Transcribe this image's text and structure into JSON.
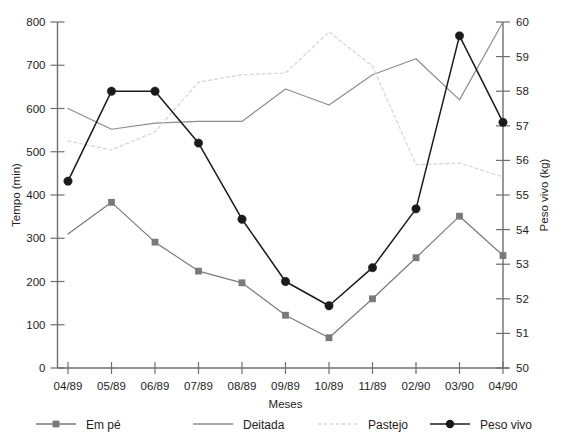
{
  "chart_data": {
    "type": "line",
    "title": "",
    "xlabel": "Meses",
    "ylabel": "Tempo (min)",
    "y2label": "Peso vivo (kg)",
    "categories": [
      "04/89",
      "05/89",
      "06/89",
      "07/89",
      "08/89",
      "09/89",
      "10/89",
      "11/89",
      "02/90",
      "03/90",
      "04/90"
    ],
    "ylim": [
      0,
      800
    ],
    "yticks": [
      0,
      100,
      200,
      300,
      400,
      500,
      600,
      700,
      800
    ],
    "y2lim": [
      50,
      60
    ],
    "y2ticks": [
      50,
      51,
      52,
      53,
      54,
      55,
      56,
      57,
      58,
      59,
      60
    ],
    "grid": false,
    "legend_position": "bottom",
    "series": [
      {
        "name": "Em pé",
        "axis": "left",
        "color": "#7a7a7a",
        "marker": "square",
        "dash": "solid",
        "values": [
          310,
          383,
          291,
          224,
          197,
          122,
          70,
          160,
          255,
          351,
          260
        ]
      },
      {
        "name": "Deitada",
        "axis": "left",
        "color": "#8d8d8d",
        "marker": "none",
        "dash": "solid",
        "values": [
          600,
          552,
          566,
          570,
          570,
          645,
          608,
          678,
          715,
          620,
          800
        ]
      },
      {
        "name": "Pastejo",
        "axis": "left",
        "color": "#d4d4d4",
        "marker": "none",
        "dash": "dotted",
        "values": [
          525,
          504,
          546,
          661,
          678,
          682,
          777,
          698,
          470,
          474,
          442
        ]
      },
      {
        "name": "Peso vivo",
        "axis": "right",
        "color": "#1a1a1a",
        "marker": "circle",
        "dash": "solid",
        "values": [
          55.4,
          58.0,
          58.0,
          56.5,
          54.3,
          52.5,
          51.8,
          52.9,
          54.6,
          59.6,
          57.1
        ]
      }
    ]
  },
  "axes": {
    "y_label": "Tempo (min)",
    "y2_label": "Peso vivo (kg)",
    "x_label": "Meses",
    "y_ticks": [
      "800",
      "700",
      "600",
      "500",
      "400",
      "300",
      "200",
      "100",
      "0"
    ],
    "y2_ticks": [
      "60",
      "59",
      "58",
      "57",
      "56",
      "55",
      "54",
      "53",
      "52",
      "51",
      "50"
    ],
    "x_ticks": [
      "04/89",
      "05/89",
      "06/89",
      "07/89",
      "08/89",
      "09/89",
      "10/89",
      "11/89",
      "02/90",
      "03/90",
      "04/90"
    ]
  },
  "legend": {
    "items": [
      {
        "label": "Em pé",
        "color": "#7a7a7a",
        "marker": "square",
        "dash": "solid"
      },
      {
        "label": "Deitada",
        "color": "#8d8d8d",
        "marker": "none",
        "dash": "solid"
      },
      {
        "label": "Pastejo",
        "color": "#d4d4d4",
        "marker": "none",
        "dash": "dotted"
      },
      {
        "label": "Peso vivo",
        "color": "#1a1a1a",
        "marker": "circle",
        "dash": "solid"
      }
    ]
  }
}
